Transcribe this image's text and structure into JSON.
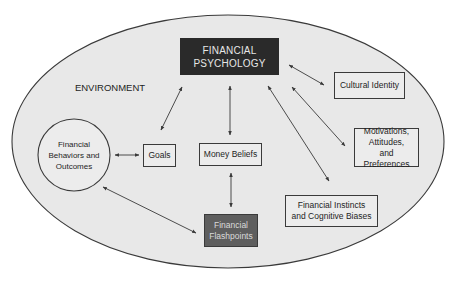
{
  "diagram": {
    "container_label": "ENVIRONMENT",
    "nodes": {
      "financial_psychology": "FINANCIAL PSYCHOLOGY",
      "cultural_identity": "Cultural Identity",
      "motivations": "Motivations, Attitudes, and Preferences",
      "instincts": "Financial Instincts and Cognitive Biases",
      "behaviors": "Financial Behaviors and Outcomes",
      "goals": "Goals",
      "money_beliefs": "Money Beliefs",
      "flashpoints": "Financial Flashpoints"
    },
    "edges": [
      {
        "from": "goals",
        "to": "financial_psychology",
        "type": "bidirectional"
      },
      {
        "from": "money_beliefs",
        "to": "financial_psychology",
        "type": "bidirectional"
      },
      {
        "from": "instincts",
        "to": "financial_psychology",
        "type": "bidirectional"
      },
      {
        "from": "motivations",
        "to": "financial_psychology",
        "type": "bidirectional"
      },
      {
        "from": "cultural_identity",
        "to": "financial_psychology",
        "type": "bidirectional"
      },
      {
        "from": "behaviors",
        "to": "goals",
        "type": "bidirectional"
      },
      {
        "from": "money_beliefs",
        "to": "flashpoints",
        "type": "bidirectional"
      },
      {
        "from": "behaviors",
        "to": "flashpoints",
        "type": "bidirectional"
      }
    ]
  }
}
